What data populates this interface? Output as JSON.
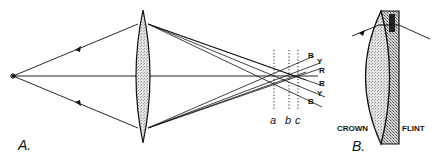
{
  "figure": {
    "panel_a": {
      "label": "A.",
      "focal_planes": [
        {
          "id": "a",
          "label": "a"
        },
        {
          "id": "b",
          "label": "b"
        },
        {
          "id": "c",
          "label": "c"
        }
      ],
      "ray_labels_top": [
        "B",
        "Y",
        "R"
      ],
      "ray_labels_bottom": [
        "R",
        "Y",
        "B"
      ]
    },
    "panel_b": {
      "label": "B.",
      "crown_label": "CROWN",
      "flint_label": "FLINT"
    },
    "colors": {
      "line": "#111111",
      "lens_fill": "#d8d8d8",
      "flint_fill": "#c4c4c4",
      "background": "#ffffff"
    }
  }
}
